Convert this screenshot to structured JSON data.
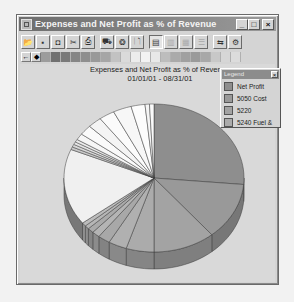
{
  "window": {
    "title": "Expenses and Net Profit as % of Revenue",
    "controls": {
      "minimize": "_",
      "maximize": "□",
      "close": "×"
    }
  },
  "toolbar": {
    "buttons": [
      {
        "name": "open-icon",
        "glyph": "📂",
        "state": "normal"
      },
      {
        "name": "save-icon",
        "glyph": "▪",
        "state": "normal"
      },
      {
        "name": "camera-icon",
        "glyph": "◘",
        "state": "normal"
      },
      {
        "name": "cut-icon",
        "glyph": "✂",
        "state": "normal"
      },
      {
        "name": "print-icon",
        "glyph": "⎙",
        "state": "normal"
      },
      {
        "name": "gallery-icon",
        "glyph": "⛟",
        "state": "normal"
      },
      {
        "name": "color-icon",
        "glyph": "❂",
        "state": "normal"
      },
      {
        "name": "print-preview-icon",
        "glyph": "🗋",
        "state": "normal"
      },
      {
        "name": "layout-icon",
        "glyph": "▤",
        "state": "pressed"
      },
      {
        "name": "grid-icon",
        "glyph": "▥",
        "state": "disabled"
      },
      {
        "name": "columns-icon",
        "glyph": "▦",
        "state": "disabled"
      },
      {
        "name": "rows-icon",
        "glyph": "☰",
        "state": "disabled"
      },
      {
        "name": "data-editor-icon",
        "glyph": "⇆",
        "state": "normal"
      },
      {
        "name": "tools-icon",
        "glyph": "⚙",
        "state": "normal"
      }
    ]
  },
  "palette": {
    "controls": [
      "←",
      "◆"
    ],
    "colors": [
      "#9c9c9c",
      "#707070",
      "#7a7a7a",
      "#858585",
      "#8e8e8e",
      "#999999",
      "#a6a6a6",
      "#c2c2c2",
      "#dadada",
      "#ececec",
      "#f3f3f3",
      "#e8e8e8",
      "#bdbdbd",
      "#aaaaaa",
      "#a0a0a0",
      "#9a9a9a",
      "#a8a8a8",
      "#c8c8c8",
      "#d6d6d6",
      "#dcdcdc"
    ]
  },
  "legend": {
    "title": "Legend",
    "close": "×",
    "items": [
      {
        "label": "Net Profit",
        "color": "#8e8e8e"
      },
      {
        "label": "5050 Cost",
        "color": "#999999"
      },
      {
        "label": "5220",
        "color": "#a3a3a3"
      },
      {
        "label": "5240 Fuel &",
        "color": "#ababab"
      }
    ]
  },
  "chart_data": {
    "type": "pie",
    "title": "Expenses and Net Profit as % of Revenue",
    "subtitle": "01/01/01 - 08/31/01",
    "style": "3d",
    "legend_position": "top-right",
    "categories": [
      "Net Profit",
      "5050 Cost",
      "5220",
      "5240 Fuel &",
      "Other 1",
      "Other 2",
      "Other 3",
      "Other 4",
      "Other 5",
      "Other 6",
      "Other 7",
      "Other 8",
      "Other 9",
      "Other 10",
      "Other 11",
      "Other 12",
      "Other 13",
      "Other 14",
      "Other 15",
      "Other 16",
      "Other 17",
      "Other 18",
      "Other 19"
    ],
    "values": [
      26.4,
      12.5,
      11.1,
      5.0,
      3.3,
      2.2,
      1.4,
      1.1,
      0.8,
      0.8,
      16.7,
      0.6,
      0.6,
      0.6,
      0.6,
      1.4,
      2.2,
      2.5,
      2.8,
      3.3,
      2.5,
      0.8,
      0.8
    ],
    "colors": [
      "#8e8e8e",
      "#999999",
      "#a3a3a3",
      "#ababab",
      "#b0b0b0",
      "#a8a8a8",
      "#b4b4b4",
      "#aaaaaa",
      "#b6b6b6",
      "#bcbcbc",
      "#f0f0f0",
      "#c8c8c8",
      "#d8d8d8",
      "#e4e4e4",
      "#ececec",
      "#f6f6f6",
      "#fafafa",
      "#f4f4f4",
      "#fbfbfb",
      "#f7f7f7",
      "#fcfcfc",
      "#f5f5f5",
      "#fafafa"
    ]
  }
}
